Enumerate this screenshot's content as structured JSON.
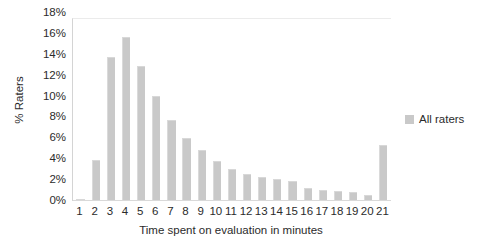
{
  "chart_data": {
    "type": "bar",
    "title": "",
    "xlabel": "Time spent on evaluation in minutes",
    "ylabel": "% Raters",
    "categories": [
      "1",
      "2",
      "3",
      "4",
      "5",
      "6",
      "7",
      "8",
      "9",
      "10",
      "11",
      "12",
      "13",
      "14",
      "15",
      "16",
      "17",
      "18",
      "19",
      "20",
      "21"
    ],
    "values": [
      0.2,
      4.1,
      14.2,
      16.2,
      13.4,
      10.4,
      8.0,
      6.2,
      5.0,
      4.0,
      3.2,
      2.7,
      2.4,
      2.2,
      2.0,
      1.3,
      1.1,
      1.0,
      0.9,
      0.6,
      5.5
    ],
    "series": [
      {
        "name": "All raters",
        "values": [
          0.2,
          4.1,
          14.2,
          16.2,
          13.4,
          10.4,
          8.0,
          6.2,
          5.0,
          4.0,
          3.2,
          2.7,
          2.4,
          2.2,
          2.0,
          1.3,
          1.1,
          1.0,
          0.9,
          0.6,
          5.5
        ]
      }
    ],
    "ylim": [
      0,
      18
    ],
    "ytick_values": [
      0,
      2,
      4,
      6,
      8,
      10,
      12,
      14,
      16,
      18
    ],
    "ytick_labels": [
      "0%",
      "2%",
      "4%",
      "6%",
      "8%",
      "10%",
      "12%",
      "14%",
      "16%",
      "18%"
    ],
    "grid": false,
    "legend": {
      "position": "right",
      "entries": [
        {
          "label": "All raters",
          "color": "#c9c9c9"
        }
      ]
    },
    "bar_color": "#c9c9c9"
  }
}
